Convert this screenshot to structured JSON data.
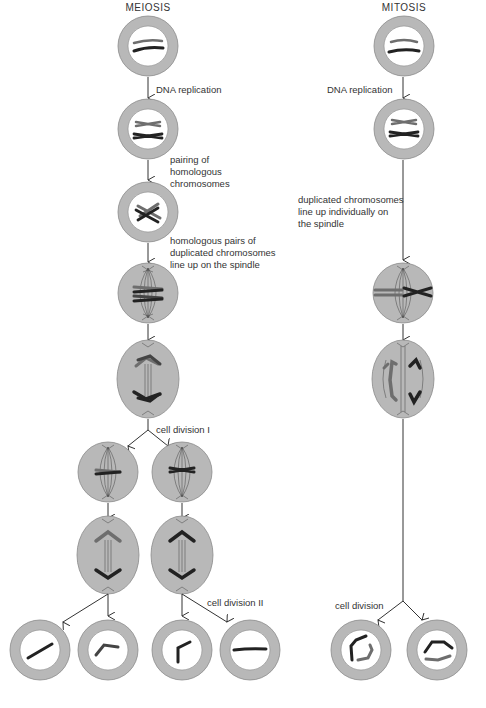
{
  "titles": {
    "meiosis": "MEIOSIS",
    "mitosis": "MITOSIS"
  },
  "labels": {
    "meiosis_dna_replication": "DNA replication",
    "mitosis_dna_replication": "DNA replication",
    "pairing": [
      "pairing of",
      "homologous",
      "chromosomes"
    ],
    "homologous_pairs": [
      "homologous pairs of",
      "duplicated chromosomes",
      "line up on the spindle"
    ],
    "individual_lineup": [
      "duplicated chromosomes",
      "line up individually on",
      "the spindle"
    ],
    "cell_division_1": "cell division I",
    "cell_division_2": "cell division II",
    "cell_division": "cell division"
  },
  "colors": {
    "cell_fill": "#b8b8b8",
    "cell_stroke": "#8a8a8a",
    "nucleus_fill": "#ffffff",
    "chromosome_dark": "#222222",
    "chromosome_light": "#6e6e6e",
    "text": "#333333"
  }
}
